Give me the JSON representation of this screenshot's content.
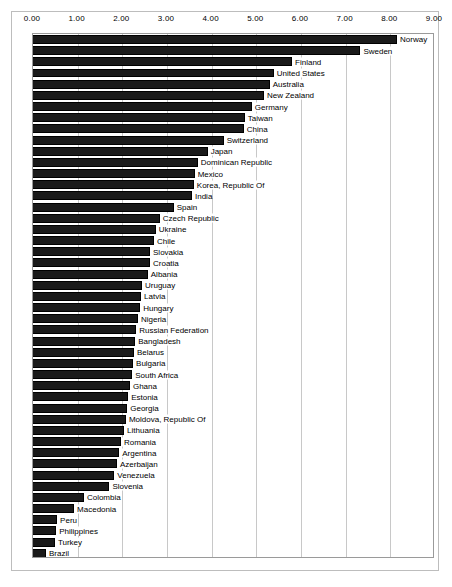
{
  "chart_data": {
    "type": "bar",
    "orientation": "horizontal",
    "title": "",
    "subtitle": "",
    "xlabel": "",
    "ylabel": "",
    "xlim": [
      0.0,
      9.0
    ],
    "xticks": [
      "0.00",
      "1.00",
      "2.00",
      "3.00",
      "4.00",
      "5.00",
      "6.00",
      "7.00",
      "8.00",
      "9.00"
    ],
    "xtick_values": [
      0,
      1,
      2,
      3,
      4,
      5,
      6,
      7,
      8,
      9
    ],
    "grid": true,
    "legend": false,
    "legend_position": "none",
    "bar_color": "#1a1a1a",
    "grid_color": "#c8c8c8",
    "categories": [
      "Norway",
      "Sweden",
      "Finland",
      "United States",
      "Australia",
      "New Zealand",
      "Germany",
      "Taiwan",
      "China",
      "Switzerland",
      "Japan",
      "Dominican Republic",
      "Mexico",
      "Korea, Republic Of",
      "India",
      "Spain",
      "Czech Republic",
      "Ukraine",
      "Chile",
      "Slovakia",
      "Croatia",
      "Albania",
      "Uruguay",
      "Latvia",
      "Hungary",
      "Nigeria",
      "Russian Federation",
      "Bangladesh",
      "Belarus",
      "Bulgaria",
      "South Africa",
      "Ghana",
      "Estonia",
      "Georgia",
      "Moldova, Republic Of",
      "Lithuania",
      "Romania",
      "Argentina",
      "Azerbaijan",
      "Venezuela",
      "Slovenia",
      "Colombia",
      "Macedonia",
      "Peru",
      "Philippines",
      "Turkey",
      "Brazil"
    ],
    "values": [
      8.15,
      7.33,
      5.8,
      5.39,
      5.3,
      5.17,
      4.9,
      4.74,
      4.72,
      4.27,
      3.91,
      3.69,
      3.62,
      3.6,
      3.56,
      3.15,
      2.84,
      2.75,
      2.71,
      2.62,
      2.62,
      2.57,
      2.44,
      2.42,
      2.4,
      2.35,
      2.31,
      2.29,
      2.26,
      2.24,
      2.22,
      2.17,
      2.13,
      2.11,
      2.08,
      2.04,
      1.97,
      1.93,
      1.88,
      1.82,
      1.71,
      1.14,
      0.92,
      0.54,
      0.52,
      0.49,
      0.29
    ]
  }
}
